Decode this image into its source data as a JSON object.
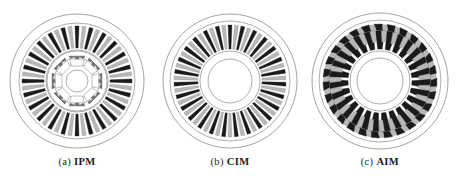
{
  "figure": {
    "type": "technical-illustration",
    "background_color": "#ffffff",
    "outline_color": "#8a8a8a",
    "conductor_dark_color": "#1a1a1a",
    "conductor_light_color": "#b8b8b8",
    "magnet_color": "#6e6e6e",
    "width": 462,
    "height": 184
  },
  "panels": [
    {
      "id": "ipm",
      "caption_tag": "(a)",
      "caption_name": "IPM",
      "caption_full": "(a) IPM",
      "center": {
        "x": 77,
        "y": 73
      },
      "radii": {
        "housing": 67,
        "stator_outer": 58,
        "stator_slot_outer": 55,
        "stator_slot_inner": 33,
        "airgap": 31,
        "rotor_outer": 30,
        "rotor_barrier_outer": 26,
        "rotor_barrier_inner": 15,
        "shaft": 11
      },
      "stator_slots": 48,
      "rotor_poles": 8,
      "magnet_count": 8,
      "flux_barrier_count": 8,
      "notes": "interior permanent magnet rotor with eight surface-tangential magnets and eight rounded flux barriers"
    },
    {
      "id": "cim",
      "caption_tag": "(b)",
      "caption_name": "CIM",
      "caption_full": "(b) CIM",
      "center": {
        "x": 77,
        "y": 73
      },
      "radii": {
        "housing": 67,
        "stator_outer": 60,
        "stator_slot_outer": 56,
        "stator_slot_inner": 32,
        "airgap": 30,
        "rotor_outer": 29,
        "shaft": 22
      },
      "stator_slots": 54,
      "rotor_poles": 0,
      "notes": "conventional induction machine with many narrow radial slots and a plain bore"
    },
    {
      "id": "aim",
      "caption_tag": "(c)",
      "caption_name": "AIM",
      "caption_full": "(c) AIM",
      "center": {
        "x": 77,
        "y": 73
      },
      "radii": {
        "housing": 68,
        "stator_outer": 61,
        "stator_slot_outer": 57,
        "stator_slot_inner": 32,
        "airgap": 30,
        "rotor_outer": 29,
        "shaft": 23
      },
      "stator_slots": 27,
      "rotor_poles": 0,
      "notes": "advanced induction machine with broad tapered slots and dark outer closing wedges"
    }
  ],
  "chart_data": {
    "type": "diagram",
    "title": "",
    "legend": [],
    "series": [
      {
        "name": "(a) IPM",
        "stator_slots": 48,
        "rotor_poles": 8,
        "magnets": 8
      },
      {
        "name": "(b) CIM",
        "stator_slots": 54,
        "rotor_poles": 0,
        "magnets": 0
      },
      {
        "name": "(c) AIM",
        "stator_slots": 27,
        "rotor_poles": 0,
        "magnets": 0
      }
    ]
  }
}
